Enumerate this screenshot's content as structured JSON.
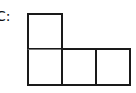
{
  "figure": {
    "label": "C:",
    "squares": [
      {
        "id": "top-left",
        "row": 0,
        "col": 0
      },
      {
        "id": "bottom-left",
        "row": 1,
        "col": 0
      },
      {
        "id": "bottom-middle",
        "row": 1,
        "col": 1
      },
      {
        "id": "bottom-right",
        "row": 1,
        "col": 2
      }
    ],
    "colors": {
      "stroke": "#1a1a1a",
      "divider": "#777777",
      "fill": "#ffffff"
    }
  }
}
